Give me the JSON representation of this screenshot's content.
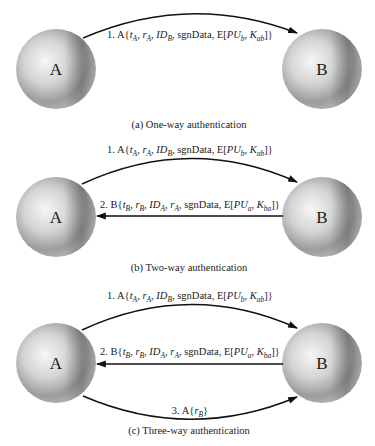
{
  "colors": {
    "sphere_highlight": "#f4f4f4",
    "sphere_mid": "#c8c8c8",
    "sphere_shadow": "#7e7e7e",
    "arrow": "#111111",
    "text": "#222222"
  },
  "panels": [
    {
      "id": "a",
      "caption": "(a) One-way authentication",
      "nodes": [
        {
          "label": "A",
          "cx": 56,
          "cy": 69,
          "r": 40
        },
        {
          "label": "B",
          "cx": 322,
          "cy": 69,
          "r": 40
        }
      ],
      "messages": [
        {
          "step": "1.",
          "direction": "A-to-B",
          "text": "1. A{tA, rA, IDB, sgnData, E[PUb, Kab]}",
          "parts": [
            {
              "t": "1. A{",
              "s": "n"
            },
            {
              "t": "t",
              "s": "i"
            },
            {
              "t": "A",
              "s": "sub"
            },
            {
              "t": ", ",
              "s": "n"
            },
            {
              "t": "r",
              "s": "i"
            },
            {
              "t": "A",
              "s": "sub"
            },
            {
              "t": ", ",
              "s": "n"
            },
            {
              "t": "ID",
              "s": "i"
            },
            {
              "t": "B",
              "s": "sub"
            },
            {
              "t": ", sgnData, E[",
              "s": "n"
            },
            {
              "t": "PU",
              "s": "i"
            },
            {
              "t": "b",
              "s": "sub"
            },
            {
              "t": ", ",
              "s": "n"
            },
            {
              "t": "K",
              "s": "i"
            },
            {
              "t": "ab",
              "s": "sub"
            },
            {
              "t": "]}",
              "s": "n"
            }
          ]
        }
      ]
    },
    {
      "id": "b",
      "caption": "(b) Two-way authentication",
      "nodes": [
        {
          "label": "A",
          "cx": 56,
          "cy": 217,
          "r": 40
        },
        {
          "label": "B",
          "cx": 322,
          "cy": 217,
          "r": 40
        }
      ],
      "messages": [
        {
          "step": "1.",
          "direction": "A-to-B",
          "text": "1. A{tA, rA, IDB, sgnData, E[PUb, Kab]}",
          "parts": [
            {
              "t": "1. A{",
              "s": "n"
            },
            {
              "t": "t",
              "s": "i"
            },
            {
              "t": "A",
              "s": "sub"
            },
            {
              "t": ", ",
              "s": "n"
            },
            {
              "t": "r",
              "s": "i"
            },
            {
              "t": "A",
              "s": "sub"
            },
            {
              "t": ", ",
              "s": "n"
            },
            {
              "t": "ID",
              "s": "i"
            },
            {
              "t": "B",
              "s": "sub"
            },
            {
              "t": ", sgnData, E[",
              "s": "n"
            },
            {
              "t": "PU",
              "s": "i"
            },
            {
              "t": "b",
              "s": "sub"
            },
            {
              "t": ", ",
              "s": "n"
            },
            {
              "t": "K",
              "s": "i"
            },
            {
              "t": "ab",
              "s": "sub"
            },
            {
              "t": "]}",
              "s": "n"
            }
          ]
        },
        {
          "step": "2.",
          "direction": "B-to-A",
          "text": "2. B{tB, rB, IDA, rA, sgnData, E[PUa, Kba]}",
          "parts": [
            {
              "t": "2. B{",
              "s": "n"
            },
            {
              "t": "t",
              "s": "i"
            },
            {
              "t": "B",
              "s": "sub"
            },
            {
              "t": ", ",
              "s": "n"
            },
            {
              "t": "r",
              "s": "i"
            },
            {
              "t": "B",
              "s": "sub"
            },
            {
              "t": ", ",
              "s": "n"
            },
            {
              "t": "ID",
              "s": "i"
            },
            {
              "t": "A",
              "s": "sub"
            },
            {
              "t": ", ",
              "s": "n"
            },
            {
              "t": "r",
              "s": "i"
            },
            {
              "t": "A",
              "s": "sub"
            },
            {
              "t": ", sgnData, E[",
              "s": "n"
            },
            {
              "t": "PU",
              "s": "i"
            },
            {
              "t": "a",
              "s": "sub"
            },
            {
              "t": ", ",
              "s": "n"
            },
            {
              "t": "K",
              "s": "i"
            },
            {
              "t": "ba",
              "s": "sub"
            },
            {
              "t": "]}",
              "s": "n"
            }
          ]
        }
      ]
    },
    {
      "id": "c",
      "caption": "(c) Three-way authentication",
      "nodes": [
        {
          "label": "A",
          "cx": 56,
          "cy": 363,
          "r": 40
        },
        {
          "label": "B",
          "cx": 322,
          "cy": 363,
          "r": 40
        }
      ],
      "messages": [
        {
          "step": "1.",
          "direction": "A-to-B",
          "text": "1. A{tA, rA, IDB, sgnData, E[PUb, Kab]}",
          "parts": [
            {
              "t": "1. A{",
              "s": "n"
            },
            {
              "t": "t",
              "s": "i"
            },
            {
              "t": "A",
              "s": "sub"
            },
            {
              "t": ", ",
              "s": "n"
            },
            {
              "t": "r",
              "s": "i"
            },
            {
              "t": "A",
              "s": "sub"
            },
            {
              "t": ", ",
              "s": "n"
            },
            {
              "t": "ID",
              "s": "i"
            },
            {
              "t": "B",
              "s": "sub"
            },
            {
              "t": ", sgnData, E[",
              "s": "n"
            },
            {
              "t": "PU",
              "s": "i"
            },
            {
              "t": "b",
              "s": "sub"
            },
            {
              "t": ", ",
              "s": "n"
            },
            {
              "t": "K",
              "s": "i"
            },
            {
              "t": "ab",
              "s": "sub"
            },
            {
              "t": "]}",
              "s": "n"
            }
          ]
        },
        {
          "step": "2.",
          "direction": "B-to-A",
          "text": "2. B{tB, rB, IDA, rA, sgnData, E[PUa, Kba]}",
          "parts": [
            {
              "t": "2. B{",
              "s": "n"
            },
            {
              "t": "t",
              "s": "i"
            },
            {
              "t": "B",
              "s": "sub"
            },
            {
              "t": ", ",
              "s": "n"
            },
            {
              "t": "r",
              "s": "i"
            },
            {
              "t": "B",
              "s": "sub"
            },
            {
              "t": ", ",
              "s": "n"
            },
            {
              "t": "ID",
              "s": "i"
            },
            {
              "t": "A",
              "s": "sub"
            },
            {
              "t": ", ",
              "s": "n"
            },
            {
              "t": "r",
              "s": "i"
            },
            {
              "t": "A",
              "s": "sub"
            },
            {
              "t": ", sgnData, E[",
              "s": "n"
            },
            {
              "t": "PU",
              "s": "i"
            },
            {
              "t": "a",
              "s": "sub"
            },
            {
              "t": ", ",
              "s": "n"
            },
            {
              "t": "K",
              "s": "i"
            },
            {
              "t": "ba",
              "s": "sub"
            },
            {
              "t": "]}",
              "s": "n"
            }
          ]
        },
        {
          "step": "3.",
          "direction": "A-to-B",
          "text": "3. A{rB}",
          "parts": [
            {
              "t": "3. A{",
              "s": "n"
            },
            {
              "t": "r",
              "s": "i"
            },
            {
              "t": "B",
              "s": "sub"
            },
            {
              "t": "}",
              "s": "n"
            }
          ]
        }
      ]
    }
  ]
}
